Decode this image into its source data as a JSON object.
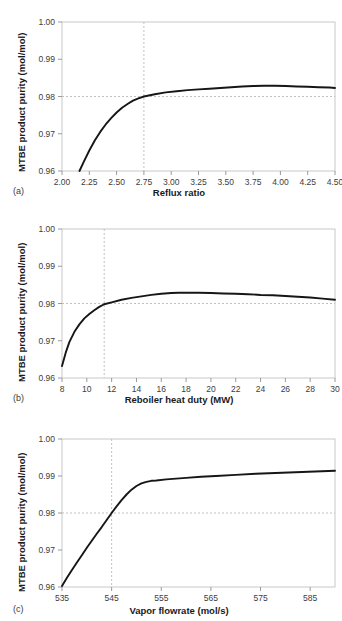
{
  "figure": {
    "background_color": "#ffffff",
    "curve_color": "#161616",
    "frame_color": "#c8c8c8",
    "guide_color": "#c0c0c0"
  },
  "panels": [
    {
      "tag": "(a)",
      "x_title": "Reflux ratio",
      "y_title": "MTBE product  purity (mol/mol)",
      "x_ticks": [
        "2.00",
        "2.25",
        "2.50",
        "2.75",
        "3.00",
        "3.25",
        "3.50",
        "3.75",
        "4.00",
        "4.25",
        "4.50"
      ],
      "y_ticks": [
        "0.96",
        "0.97",
        "0.98",
        "0.99",
        "1.00"
      ]
    },
    {
      "tag": "(b)",
      "x_title": "Reboiler heat duty (MW)",
      "y_title": "MTBE product purity (mol/mol)",
      "x_ticks": [
        "8",
        "10",
        "12",
        "14",
        "16",
        "18",
        "20",
        "22",
        "24",
        "26",
        "28",
        "30"
      ],
      "y_ticks": [
        "0.96",
        "0.97",
        "0.98",
        "0.99",
        "1.00"
      ]
    },
    {
      "tag": "(c)",
      "x_title": "Vapor flowrate (mol/s)",
      "y_title": "MTBE product purity (mol/mol)",
      "x_ticks": [
        "535",
        "545",
        "555",
        "565",
        "575",
        "585"
      ],
      "y_ticks": [
        "0.96",
        "0.97",
        "0.98",
        "0.99",
        "1.00"
      ]
    }
  ],
  "chart_data": [
    {
      "type": "line",
      "panel": "(a)",
      "title": "",
      "xlabel": "Reflux ratio",
      "ylabel": "MTBE product  purity (mol/mol)",
      "xlim": [
        2.0,
        4.5
      ],
      "ylim": [
        0.96,
        1.0
      ],
      "xticks": [
        2.0,
        2.25,
        2.5,
        2.75,
        3.0,
        3.25,
        3.5,
        3.75,
        4.0,
        4.25,
        4.5
      ],
      "yticks": [
        0.96,
        0.97,
        0.98,
        0.99,
        1.0
      ],
      "grid": false,
      "legend": "none",
      "guide_lines": {
        "vertical_x": 2.75,
        "horizontal_y": 0.98,
        "style": "dashed"
      },
      "series": [
        {
          "name": "MTBE product purity vs reflux ratio",
          "x": [
            2.16,
            2.2,
            2.25,
            2.3,
            2.35,
            2.4,
            2.45,
            2.5,
            2.55,
            2.6,
            2.65,
            2.7,
            2.75,
            2.85,
            2.95,
            3.05,
            3.15,
            3.25,
            3.35,
            3.45,
            3.55,
            3.65,
            3.75,
            3.85,
            3.95,
            4.05,
            4.15,
            4.25,
            4.35,
            4.45,
            4.5
          ],
          "y": [
            0.96,
            0.9625,
            0.9655,
            0.9682,
            0.9705,
            0.9725,
            0.9742,
            0.9757,
            0.977,
            0.978,
            0.9789,
            0.9795,
            0.98,
            0.9806,
            0.9811,
            0.9814,
            0.9817,
            0.9819,
            0.9821,
            0.9823,
            0.9825,
            0.9827,
            0.9828,
            0.9829,
            0.9829,
            0.9828,
            0.9827,
            0.9826,
            0.9825,
            0.9824,
            0.9823
          ]
        }
      ]
    },
    {
      "type": "line",
      "panel": "(b)",
      "title": "",
      "xlabel": "Reboiler heat duty (MW)",
      "ylabel": "MTBE product purity (mol/mol)",
      "xlim": [
        8,
        30
      ],
      "ylim": [
        0.96,
        1.0
      ],
      "xticks": [
        8,
        10,
        12,
        14,
        16,
        18,
        20,
        22,
        24,
        26,
        28,
        30
      ],
      "yticks": [
        0.96,
        0.97,
        0.98,
        0.99,
        1.0
      ],
      "grid": false,
      "legend": "none",
      "guide_lines": {
        "vertical_x": 11.4,
        "horizontal_y": 0.98,
        "style": "dashed"
      },
      "series": [
        {
          "name": "MTBE product purity vs reboiler heat duty",
          "x": [
            8.0,
            8.3,
            8.6,
            9.0,
            9.4,
            9.8,
            10.2,
            10.6,
            11.0,
            11.4,
            12.0,
            12.8,
            13.6,
            14.4,
            15.2,
            16.0,
            16.8,
            17.4,
            18.0,
            19.0,
            20.0,
            21.0,
            22.0,
            23.0,
            24.0,
            25.0,
            26.0,
            27.0,
            28.0,
            29.0,
            30.0
          ],
          "y": [
            0.9632,
            0.9668,
            0.9697,
            0.9724,
            0.9744,
            0.976,
            0.9772,
            0.9782,
            0.9791,
            0.9798,
            0.9803,
            0.981,
            0.9815,
            0.9819,
            0.9823,
            0.9826,
            0.9828,
            0.9829,
            0.9829,
            0.9829,
            0.9828,
            0.9827,
            0.9826,
            0.9825,
            0.9823,
            0.9822,
            0.982,
            0.9818,
            0.9816,
            0.9813,
            0.981
          ]
        }
      ]
    },
    {
      "type": "line",
      "panel": "(c)",
      "title": "",
      "xlabel": "Vapor flowrate (mol/s)",
      "ylabel": "MTBE product purity (mol/mol)",
      "xlim": [
        535,
        590
      ],
      "ylim": [
        0.96,
        1.0
      ],
      "xticks": [
        535,
        545,
        555,
        565,
        575,
        585
      ],
      "yticks": [
        0.96,
        0.97,
        0.98,
        0.99,
        1.0
      ],
      "grid": false,
      "legend": "none",
      "guide_lines": {
        "vertical_x": 545,
        "horizontal_y": 0.98,
        "style": "dashed"
      },
      "series": [
        {
          "name": "MTBE product purity vs vapor flowrate",
          "x": [
            535,
            536,
            537,
            538,
            539,
            540,
            541,
            542,
            543,
            544,
            545,
            546,
            547,
            548,
            549,
            550,
            551,
            552,
            553,
            554,
            556,
            558,
            560,
            563,
            566,
            570,
            574,
            578,
            582,
            586,
            590
          ],
          "y": [
            0.9603,
            0.9625,
            0.9646,
            0.9666,
            0.9686,
            0.9706,
            0.9725,
            0.9744,
            0.9762,
            0.9781,
            0.98,
            0.9818,
            0.9835,
            0.985,
            0.9863,
            0.9873,
            0.988,
            0.9884,
            0.9887,
            0.9888,
            0.9891,
            0.9893,
            0.9895,
            0.9898,
            0.99,
            0.9903,
            0.9906,
            0.9908,
            0.991,
            0.9912,
            0.9914
          ]
        }
      ]
    }
  ]
}
